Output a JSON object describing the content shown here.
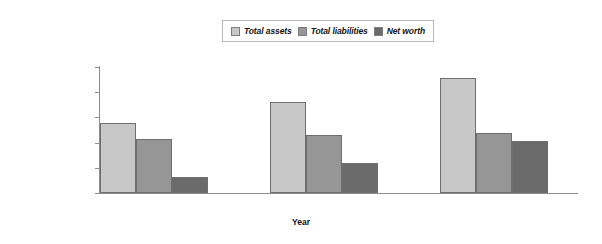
{
  "chart_data": {
    "type": "bar",
    "title": "",
    "xlabel": "Year",
    "ylabel": "",
    "categories": [
      "1",
      "2",
      "3"
    ],
    "series": [
      {
        "name": "Total assets",
        "color": "#c8c8c8",
        "values": [
          138000,
          180000,
          228000
        ]
      },
      {
        "name": "Total liabilities",
        "color": "#969696",
        "values": [
          107000,
          115000,
          119000
        ]
      },
      {
        "name": "Net worth",
        "color": "#6b6b6b",
        "values": [
          32000,
          60000,
          103000
        ]
      }
    ],
    "ylim": [
      0,
      250000
    ],
    "ytick_values": [
      0,
      50000,
      100000,
      150000,
      200000,
      250000
    ],
    "ytick_labels": [
      "$0",
      "$50,000",
      "$100,000",
      "$150,000",
      "$200,000",
      "$250,000"
    ],
    "grid": false,
    "legend_position": "top-center",
    "axis_color": "#8c8c8c",
    "bar_border_color": "#6e6e6e",
    "background": "#ffffff"
  }
}
